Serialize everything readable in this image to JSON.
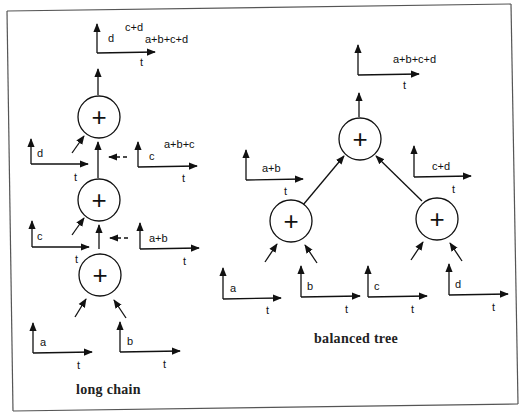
{
  "figure": {
    "frame_color": "#555555",
    "line_color": "#111111",
    "background": "#ffffff"
  },
  "long_chain": {
    "caption": "long chain",
    "output_plot": {
      "y_labels": [
        "d",
        "c+d",
        "a+b+c+d"
      ],
      "x_label": "t"
    },
    "adders": [
      {
        "symbol": "+"
      },
      {
        "symbol": "+"
      },
      {
        "symbol": "+"
      }
    ],
    "input_plots": [
      {
        "label": "d",
        "x_label": "t"
      },
      {
        "label": "c",
        "x_label": "t"
      },
      {
        "label": "a",
        "x_label": "t"
      },
      {
        "label": "b",
        "x_label": "t"
      }
    ],
    "intermediate_plots": [
      {
        "labels": [
          "c",
          "a+b+c"
        ],
        "x_label": "t"
      },
      {
        "labels": [
          "a+b"
        ],
        "x_label": "t"
      }
    ]
  },
  "balanced_tree": {
    "caption": "balanced tree",
    "output_plot": {
      "y_label": "a+b+c+d",
      "x_label": "t"
    },
    "adders": [
      {
        "symbol": "+"
      },
      {
        "symbol": "+"
      },
      {
        "symbol": "+"
      }
    ],
    "intermediate_plots": [
      {
        "label": "a+b",
        "x_label": "t"
      },
      {
        "label": "c+d",
        "x_label": "t"
      }
    ],
    "input_plots": [
      {
        "label": "a",
        "x_label": "t"
      },
      {
        "label": "b",
        "x_label": "t"
      },
      {
        "label": "c",
        "x_label": "t"
      },
      {
        "label": "d",
        "x_label": "t"
      }
    ]
  }
}
